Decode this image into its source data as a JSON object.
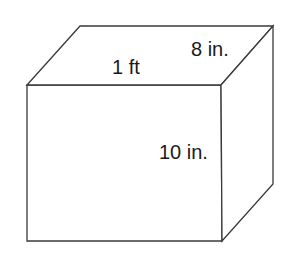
{
  "figure": {
    "name": "rectangular-prism-diagram",
    "shape": "rectangular prism",
    "background_color": "#ffffff",
    "line_color": "#3a3a3a",
    "label_color": "#1a1a1a",
    "labels": {
      "width": "1 ft",
      "depth": "8 in.",
      "height": "10 in."
    },
    "geometry": {
      "front_face": {
        "top_left": [
          27,
          85
        ],
        "top_right": [
          221,
          85
        ],
        "bottom_right": [
          222,
          241
        ],
        "bottom_left": [
          27,
          241
        ]
      },
      "back_top_left": [
        80,
        26
      ],
      "back_top_right": [
        273,
        26
      ],
      "back_bottom_right": [
        273,
        184
      ]
    }
  }
}
